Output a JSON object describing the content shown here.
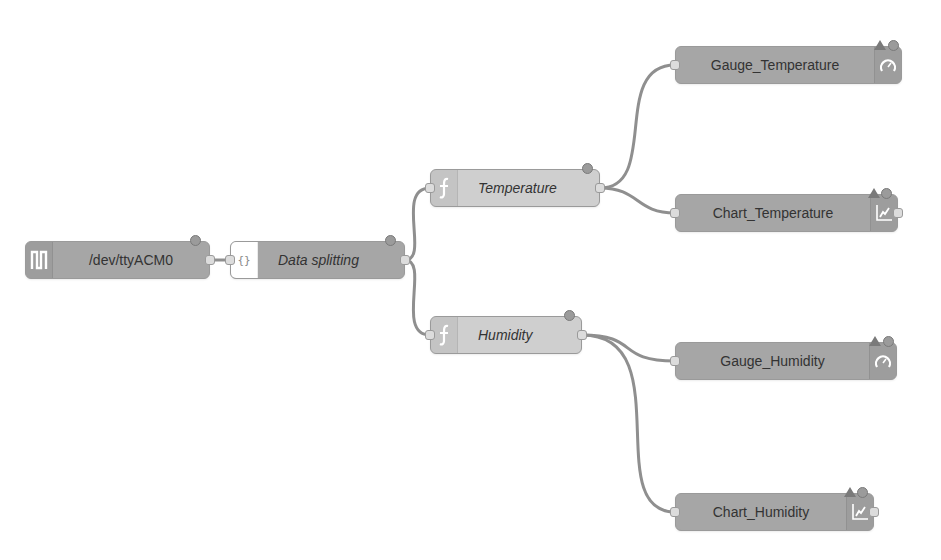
{
  "flow": {
    "nodes": [
      {
        "id": "serial",
        "label": "/dev/ttyACM0",
        "type": "serial-in",
        "icon": "serial-port-icon"
      },
      {
        "id": "split",
        "label": "Data splitting",
        "type": "json",
        "icon": "json-braces-icon"
      },
      {
        "id": "temp",
        "label": "Temperature",
        "type": "function",
        "icon": "function-icon"
      },
      {
        "id": "hum",
        "label": "Humidity",
        "type": "function",
        "icon": "function-icon"
      },
      {
        "id": "gauge_temp",
        "label": "Gauge_Temperature",
        "type": "ui-gauge",
        "icon": "gauge-icon"
      },
      {
        "id": "chart_temp",
        "label": "Chart_Temperature",
        "type": "ui-chart",
        "icon": "chart-icon"
      },
      {
        "id": "gauge_hum",
        "label": "Gauge_Humidity",
        "type": "ui-gauge",
        "icon": "gauge-icon"
      },
      {
        "id": "chart_hum",
        "label": "Chart_Humidity",
        "type": "ui-chart",
        "icon": "chart-icon"
      }
    ],
    "wires": [
      {
        "from": "serial",
        "to": "split"
      },
      {
        "from": "split",
        "to": "temp"
      },
      {
        "from": "split",
        "to": "hum"
      },
      {
        "from": "temp",
        "to": "gauge_temp"
      },
      {
        "from": "temp",
        "to": "chart_temp"
      },
      {
        "from": "hum",
        "to": "gauge_hum"
      },
      {
        "from": "hum",
        "to": "chart_hum"
      }
    ]
  },
  "colors": {
    "node_dark": "#a6a6a6",
    "node_light": "#cfcfcf",
    "wire": "#8f8f8f",
    "status": "#9b9b9b",
    "background": "#ffffff"
  }
}
